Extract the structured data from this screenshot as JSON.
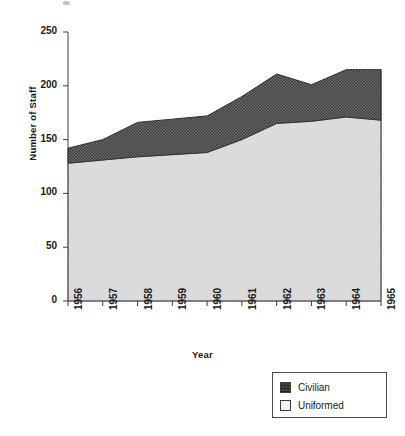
{
  "chart_data": {
    "type": "area",
    "stacked": true,
    "title": "",
    "xlabel": "Year",
    "ylabel": "Number of Staff",
    "categories": [
      "1956",
      "1957",
      "1958",
      "1959",
      "1960",
      "1961",
      "1962",
      "1963",
      "1964",
      "1965"
    ],
    "x": [
      1956,
      1957,
      1958,
      1959,
      1960,
      1961,
      1962,
      1963,
      1964,
      1965
    ],
    "series": [
      {
        "name": "Uniformed",
        "values": [
          128,
          131,
          134,
          136,
          138,
          150,
          165,
          167,
          171,
          168
        ],
        "color": "#d9d9d9"
      },
      {
        "name": "Civilian",
        "values": [
          14,
          19,
          32,
          33,
          34,
          40,
          46,
          34,
          44,
          47
        ],
        "color": "#585858"
      }
    ],
    "totals": [
      142,
      150,
      166,
      169,
      172,
      190,
      211,
      201,
      215,
      215
    ],
    "ylim": [
      0,
      250
    ],
    "yticks": [
      0,
      50,
      100,
      150,
      200,
      250
    ],
    "ytick_labels": [
      "0",
      "50",
      "100",
      "150",
      "200",
      "250"
    ],
    "grid": false,
    "legend_position": "bottom-right",
    "legend_entries": [
      {
        "label": "Civilian",
        "color": "#585858"
      },
      {
        "label": "Uniformed",
        "color": "#ededed"
      }
    ]
  }
}
